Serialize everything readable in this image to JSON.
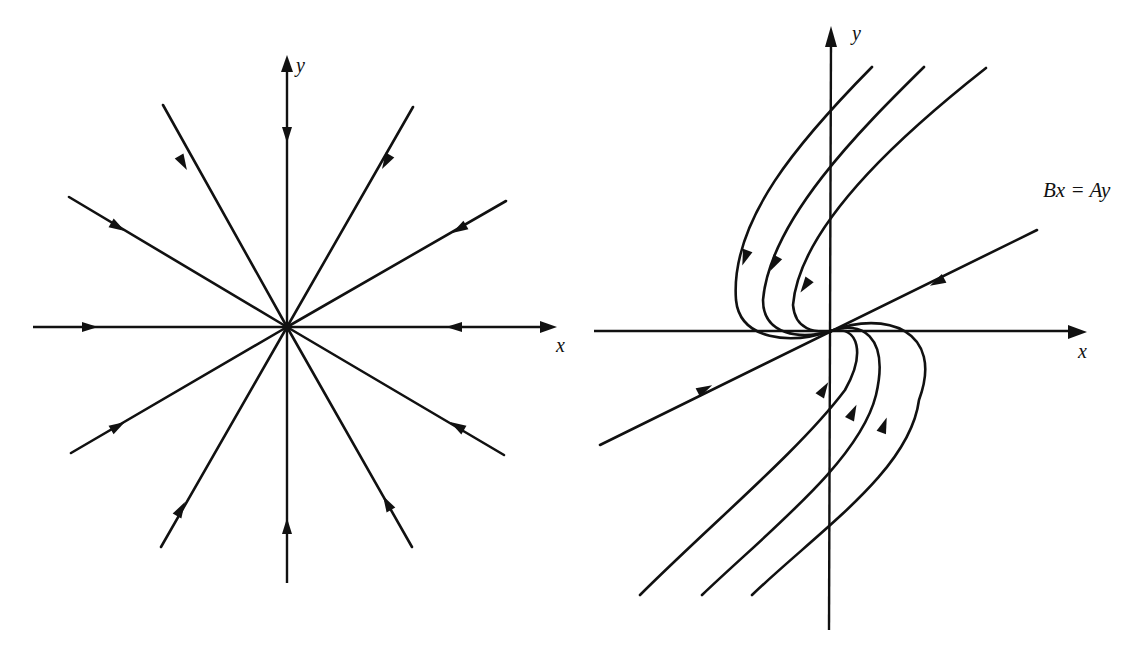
{
  "figure": {
    "left_panel": {
      "name": "Star node (proper node), all trajectories approach origin along straight lines",
      "x_axis_label": "x",
      "y_axis_label": "y",
      "ray_count": 12,
      "flow_direction": "inward to origin"
    },
    "right_panel": {
      "name": "Improper (degenerate) node with single eigen-direction",
      "x_axis_label": "x",
      "y_axis_label": "y",
      "eigenline_label": "Bx = Ay",
      "trajectory_count": 6,
      "flow_direction": "inward to origin, tangent to eigenline"
    },
    "colors": {
      "ink": "#111111",
      "background": "#ffffff"
    }
  }
}
